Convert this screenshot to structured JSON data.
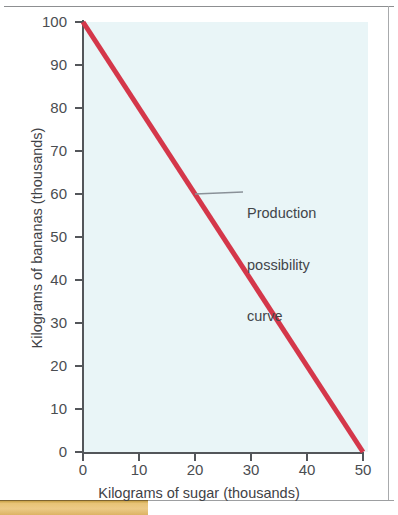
{
  "page": {
    "background_color": "#ffffff",
    "border_color": "#8d8f91",
    "accent_strip_color": "#e7c377"
  },
  "chart_data": {
    "type": "line",
    "title": "",
    "xlabel": "Kilograms of sugar (thousands)",
    "ylabel": "Kilograms of bananas (thousands)",
    "xlim": [
      0,
      50
    ],
    "ylim": [
      0,
      100
    ],
    "grid": false,
    "legend": "none",
    "plot_background_color": "#e9f5f7",
    "axis_color": "#53565a",
    "series": [
      {
        "name": "Production possibility curve",
        "color": "#d4374a",
        "line_width": 5,
        "x": [
          0,
          50
        ],
        "values": [
          100,
          0
        ]
      }
    ],
    "x_ticks": [
      "0",
      "10",
      "20",
      "30",
      "40",
      "50"
    ],
    "x_tick_values": [
      0,
      10,
      20,
      30,
      40,
      50
    ],
    "y_ticks": [
      "0",
      "10",
      "20",
      "30",
      "40",
      "50",
      "60",
      "70",
      "80",
      "90",
      "100"
    ],
    "y_tick_values": [
      0,
      10,
      20,
      30,
      40,
      50,
      60,
      70,
      80,
      90,
      100
    ],
    "annotations": [
      {
        "text": "Production\npossibility\ncurve",
        "line1": "Production",
        "line2": "possibility",
        "line3": "curve",
        "points_to_x": 20,
        "points_to_y": 60,
        "color": "#42454a",
        "leader_color": "#8a9198"
      }
    ]
  }
}
